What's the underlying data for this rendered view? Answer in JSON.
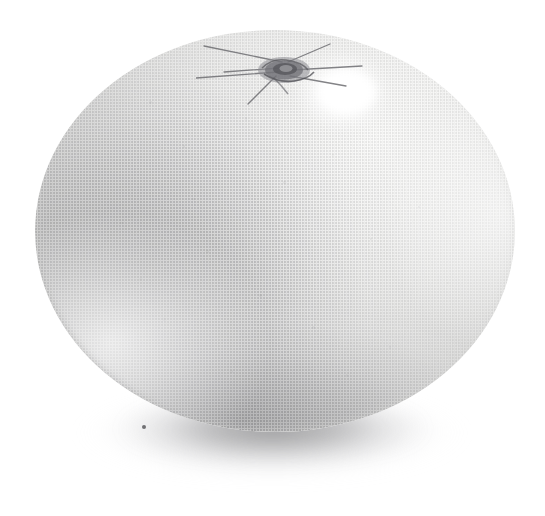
{
  "image": {
    "subject": "orange",
    "title": "Orange fruit, whole",
    "medium": "halftone print illustration",
    "description": "Monochrome halftone engraving of a single whole citrus fruit (orange) resting on a surface, viewed from the side with the stem scar at the top.",
    "background_color": "#ffffff",
    "canvas": {
      "width": 545,
      "height": 516
    }
  },
  "subject": {
    "label": "citrus-fruit-body",
    "shape": "oblate spheroid",
    "bounds": {
      "x": 35,
      "y": 30,
      "width": 480,
      "height": 402
    },
    "base_color": "#f2f2f1",
    "shadow_color": "#cfcfce",
    "highlight_color": "#ffffff"
  },
  "features": {
    "calyx": {
      "label": "stem scar / calyx",
      "center": {
        "x": 272,
        "y": 80
      },
      "ray_count": 7,
      "ink_color": "#6e6e72"
    },
    "specular_highlight": {
      "label": "specular highlight",
      "center": {
        "x": 347,
        "y": 95
      },
      "width": 104,
      "height": 88,
      "color": "#ffffff"
    },
    "terminator": {
      "label": "shaded left and lower-left flank",
      "color": "#a8a8aa"
    },
    "rim_light": {
      "label": "rim light along lower-left contour",
      "color": "#ffffff"
    },
    "cast_shadow": {
      "label": "cast shadow",
      "bounds": {
        "x": 72,
        "y": 386,
        "width": 400,
        "height": 108
      },
      "color": "#78787a"
    },
    "ink_speck": {
      "label": "print ink speck",
      "position": {
        "x": 142,
        "y": 425
      },
      "color": "#46464a"
    }
  },
  "texture": {
    "type": "halftone dot screen",
    "dot_pitch_px": 3,
    "scanline_pitch_px": 2,
    "dot_color": "#6e6e73"
  },
  "pores": [
    {
      "x": 0.24,
      "y": 0.18,
      "r": 1.4,
      "o": 0.3
    },
    {
      "x": 0.31,
      "y": 0.29,
      "r": 1.1,
      "o": 0.26
    },
    {
      "x": 0.44,
      "y": 0.22,
      "r": 1.2,
      "o": 0.22
    },
    {
      "x": 0.52,
      "y": 0.38,
      "r": 1.3,
      "o": 0.24
    },
    {
      "x": 0.62,
      "y": 0.31,
      "r": 1.0,
      "o": 0.2
    },
    {
      "x": 0.7,
      "y": 0.52,
      "r": 1.4,
      "o": 0.26
    },
    {
      "x": 0.8,
      "y": 0.44,
      "r": 1.1,
      "o": 0.22
    },
    {
      "x": 0.86,
      "y": 0.63,
      "r": 1.2,
      "o": 0.2
    },
    {
      "x": 0.36,
      "y": 0.55,
      "r": 1.5,
      "o": 0.3
    },
    {
      "x": 0.47,
      "y": 0.66,
      "r": 1.3,
      "o": 0.28
    },
    {
      "x": 0.58,
      "y": 0.74,
      "r": 1.2,
      "o": 0.26
    },
    {
      "x": 0.27,
      "y": 0.72,
      "r": 1.6,
      "o": 0.32
    },
    {
      "x": 0.18,
      "y": 0.48,
      "r": 1.4,
      "o": 0.3
    },
    {
      "x": 0.65,
      "y": 0.86,
      "r": 1.3,
      "o": 0.24
    },
    {
      "x": 0.74,
      "y": 0.79,
      "r": 1.1,
      "o": 0.2
    },
    {
      "x": 0.41,
      "y": 0.85,
      "r": 1.5,
      "o": 0.28
    },
    {
      "x": 0.55,
      "y": 0.14,
      "r": 1.0,
      "o": 0.18
    },
    {
      "x": 0.33,
      "y": 0.42,
      "r": 1.2,
      "o": 0.26
    },
    {
      "x": 0.9,
      "y": 0.36,
      "r": 1.0,
      "o": 0.16
    },
    {
      "x": 0.22,
      "y": 0.62,
      "r": 1.3,
      "o": 0.3
    }
  ],
  "calyx_rays": [
    {
      "x1": 86,
      "y1": 20,
      "x2": 8,
      "y2": 4
    },
    {
      "x1": 84,
      "y1": 26,
      "x2": 28,
      "y2": 30
    },
    {
      "x1": 82,
      "y1": 30,
      "x2": 0,
      "y2": 36
    },
    {
      "x1": 80,
      "y1": 34,
      "x2": 52,
      "y2": 62
    },
    {
      "x1": 92,
      "y1": 20,
      "x2": 134,
      "y2": 2
    },
    {
      "x1": 96,
      "y1": 28,
      "x2": 166,
      "y2": 24
    },
    {
      "x1": 94,
      "y1": 34,
      "x2": 150,
      "y2": 44
    }
  ]
}
